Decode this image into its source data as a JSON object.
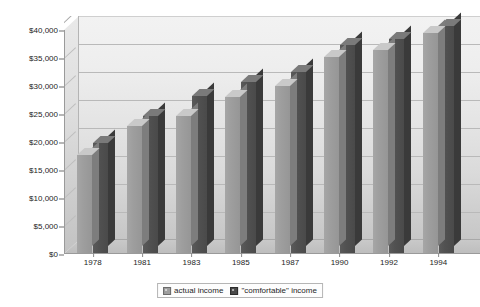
{
  "chart_data": {
    "type": "bar",
    "title": "",
    "subtitle": "",
    "xlabel": "",
    "ylabel": "",
    "categories": [
      "1978",
      "1981",
      "1983",
      "1985",
      "1987",
      "1990",
      "1992",
      "1994"
    ],
    "series": [
      {
        "name": "actual income",
        "color": "#9e9e9e",
        "values": [
          17500,
          22700,
          24400,
          27900,
          29800,
          35000,
          36200,
          39200
        ]
      },
      {
        "name": "\"comfortable\" income",
        "color": "#4a4a4a",
        "values": [
          19700,
          24500,
          28000,
          30500,
          32300,
          37200,
          38200,
          40500
        ]
      }
    ],
    "ylim": [
      0,
      40000
    ],
    "ytick_values": [
      0,
      5000,
      10000,
      15000,
      20000,
      25000,
      30000,
      35000,
      40000
    ],
    "ytick_labels": [
      "$0",
      "$5,000",
      "$10,000",
      "$15,000",
      "$20,000",
      "$25,000",
      "$30,000",
      "$35,000",
      "$40,000"
    ],
    "grid": true,
    "grid_axis": "y",
    "legend_position": "bottom",
    "style": "3d-column-grayscale"
  },
  "legend": {
    "items": [
      {
        "label": "actual income",
        "swatch": "actual-income-swatch"
      },
      {
        "label": "\"comfortable\" income",
        "swatch": "comfortable-income-swatch"
      }
    ]
  },
  "colors": {
    "actual": "#9e9e9e",
    "comfortable": "#4a4a4a",
    "gridline": "#b9b9b9",
    "axis": "#8a8a8a",
    "text": "#1d1d1d",
    "background": "#ffffff"
  }
}
